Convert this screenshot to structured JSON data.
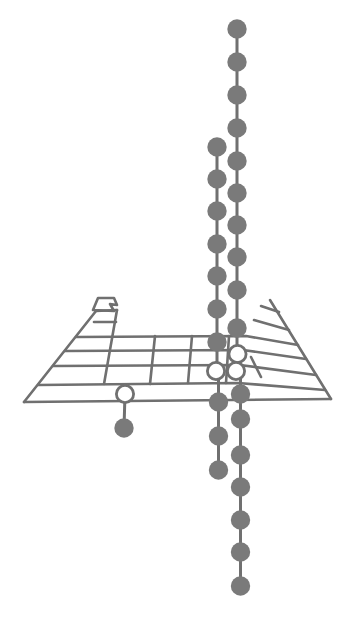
{
  "page": {
    "background": "#ffffff",
    "width": 362,
    "height": 630
  },
  "diagram": {
    "ink_color": "#6f6f6f",
    "dot_color": "#7a7a7a",
    "ring_fill": "#ffffff",
    "dot_radius": 9.7,
    "ring_radius": 8.6,
    "ring_stroke": 2.8,
    "grid_stroke": 2.6,
    "chain_stroke": 3,
    "blur": 0.45,
    "table": {
      "flag": [
        [
          93,
          310
        ],
        [
          98,
          298
        ],
        [
          114,
          298
        ],
        [
          117,
          305
        ],
        [
          110,
          304
        ],
        [
          114,
          311
        ]
      ],
      "lines": [
        {
          "name": "front-edge",
          "points": [
            [
              24,
              402
            ],
            [
              331,
              399
            ]
          ]
        },
        {
          "name": "left-edge",
          "points": [
            [
              24,
              402
            ],
            [
              96,
              311
            ]
          ]
        },
        {
          "name": "right-edge",
          "points": [
            [
              331,
              399
            ],
            [
              270,
              300
            ]
          ]
        },
        {
          "name": "s-block-top",
          "points": [
            [
              96,
              311
            ],
            [
              117,
              310
            ]
          ]
        },
        {
          "name": "s-block-right",
          "points": [
            [
              117,
              310
            ],
            [
              104,
              384
            ]
          ]
        },
        {
          "name": "s-block-row",
          "points": [
            [
              94,
              322
            ],
            [
              116,
              322
            ]
          ]
        },
        {
          "name": "period-row-1",
          "points": [
            [
              76,
              337
            ],
            [
              246,
              336
            ],
            [
              298,
              345
            ]
          ]
        },
        {
          "name": "period-row-2",
          "points": [
            [
              65,
              351
            ],
            [
              243,
              350
            ],
            [
              306,
              359
            ]
          ]
        },
        {
          "name": "period-row-3",
          "points": [
            [
              53,
              366
            ],
            [
              240,
              365
            ],
            [
              316,
              375
            ]
          ]
        },
        {
          "name": "period-row-4",
          "points": [
            [
              38,
              385
            ],
            [
              238,
              383
            ],
            [
              325,
              390
            ]
          ]
        },
        {
          "name": "p-block-row-1",
          "points": [
            [
              261,
              306
            ],
            [
              279,
              312
            ]
          ]
        },
        {
          "name": "p-block-row-2",
          "points": [
            [
              254,
              320
            ],
            [
              289,
              330
            ]
          ]
        },
        {
          "name": "column-line-1",
          "points": [
            [
              155,
              336
            ],
            [
              150,
              384
            ]
          ]
        },
        {
          "name": "column-line-2",
          "points": [
            [
              192,
              336
            ],
            [
              188,
              383
            ]
          ]
        },
        {
          "name": "column-line-3",
          "points": [
            [
              229,
              336
            ],
            [
              226,
              383
            ]
          ]
        },
        {
          "name": "column-line-4",
          "points": [
            [
              251,
              357
            ],
            [
              261,
              377
            ]
          ]
        }
      ]
    },
    "chains": [
      {
        "name": "left-chain",
        "x_above": 217,
        "x_below": 218.5,
        "split_y": 372,
        "dots_above": [
          147,
          179,
          211,
          244,
          276,
          309,
          342
        ],
        "rings": [
          [
            216,
            371
          ]
        ],
        "dots_below": [
          402,
          436,
          470
        ]
      },
      {
        "name": "right-chain",
        "x_above": 237,
        "x_below": 240.5,
        "split_y": 372,
        "dots_above": [
          29,
          62,
          95,
          128,
          161,
          193,
          225,
          257,
          290,
          328
        ],
        "rings": [
          [
            237.5,
            354
          ],
          [
            236,
            371
          ]
        ],
        "dots_below": [
          394,
          419,
          455,
          487,
          520,
          552,
          586
        ]
      }
    ],
    "lollipop": {
      "name": "front-row-lollipop",
      "ring": [
        125,
        394
      ],
      "dot": [
        124,
        428
      ]
    }
  }
}
